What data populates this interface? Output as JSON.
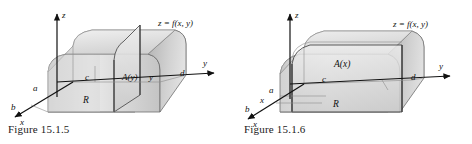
{
  "page": {
    "background_color": "#ffffff",
    "width": 472,
    "height": 144
  },
  "figures": [
    {
      "id": "figure-15-1-5",
      "caption": "Figure 15.1.5",
      "surface_label": "z = f(x, y)",
      "axes": {
        "z_label": "z",
        "y_label": "y",
        "x_label": "x"
      },
      "region_label": "R",
      "cross_section_label": "A(y)",
      "slice_variable_label": "y",
      "bounds": {
        "x_lower": "b",
        "x_upper": "a",
        "y_lower": "c",
        "y_upper": "d"
      },
      "colors": {
        "solid_light": "#e9e9e9",
        "solid_mid": "#cfcfcf",
        "solid_dark": "#a9a9a9",
        "base_region": "#bdbdbd",
        "outline": "#4a4a4a",
        "axis": "#111111"
      }
    },
    {
      "id": "figure-15-1-6",
      "caption": "Figure 15.1.6",
      "surface_label": "z = f(x, y)",
      "axes": {
        "z_label": "z",
        "y_label": "y",
        "x_label": "x"
      },
      "region_label": "R",
      "cross_section_label": "A(x)",
      "slice_variable_label": "x",
      "bounds": {
        "x_lower": "b",
        "x_upper": "a",
        "y_lower": "c",
        "y_upper": "d"
      },
      "colors": {
        "solid_light": "#e9e9e9",
        "solid_mid": "#cfcfcf",
        "solid_dark": "#a9a9a9",
        "base_region": "#bdbdbd",
        "outline": "#4a4a4a",
        "axis": "#111111"
      }
    }
  ]
}
